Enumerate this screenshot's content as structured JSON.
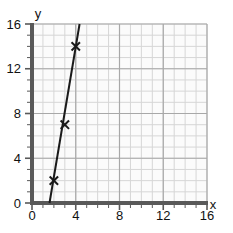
{
  "chart_data": {
    "type": "line",
    "title": "",
    "xlabel": "x",
    "ylabel": "y",
    "xlim": [
      0,
      16
    ],
    "ylim": [
      0,
      16
    ],
    "xticks": [
      0,
      4,
      8,
      12,
      16
    ],
    "yticks": [
      0,
      4,
      8,
      12,
      16
    ],
    "xtick_labels": [
      "0",
      "4",
      "8",
      "12",
      "16"
    ],
    "ytick_labels": [
      "0",
      "4",
      "8",
      "12",
      "16"
    ],
    "grid": true,
    "grid_minor_step": 1,
    "grid_major_step": 4,
    "legend": "none",
    "series": [
      {
        "name": "line",
        "marker": "x",
        "points": [
          {
            "x": 2,
            "y": 2
          },
          {
            "x": 3,
            "y": 7
          },
          {
            "x": 4,
            "y": 14
          }
        ],
        "line_from": {
          "x": 1.6,
          "y": 0
        },
        "line_to": {
          "x": 4.35,
          "y": 16
        }
      }
    ]
  },
  "colors": {
    "axis": "#595959",
    "grid_minor": "#d6d6d6",
    "grid_major": "#a8a8a8",
    "line": "#1a1a1a",
    "marker": "#1a1a1a",
    "text": "#111111",
    "plot_background": "#fbfbfb"
  },
  "geometry": {
    "plot_left": 32,
    "plot_right": 207,
    "plot_top": 24,
    "plot_bottom": 203
  }
}
